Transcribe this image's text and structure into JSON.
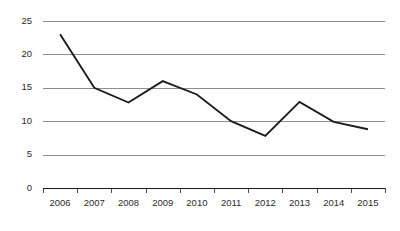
{
  "chart_data": {
    "type": "line",
    "title": "",
    "subtitle": "",
    "xlabel": "",
    "ylabel": "",
    "categories": [
      "2006",
      "2007",
      "2008",
      "2009",
      "2010",
      "2011",
      "2012",
      "2013",
      "2014",
      "2015"
    ],
    "values": [
      23,
      15,
      12.8,
      16,
      14,
      10,
      7.8,
      12.9,
      9.9,
      8.8
    ],
    "series": [
      {
        "name": "",
        "values": [
          23,
          15,
          12.8,
          16,
          14,
          10,
          7.8,
          12.9,
          9.9,
          8.8
        ]
      }
    ],
    "ylim": [
      0,
      25
    ],
    "ytick_labels": [
      "0",
      "5",
      "10",
      "15",
      "20",
      "25"
    ],
    "ytick_values": [
      0,
      5,
      10,
      15,
      20,
      25
    ],
    "xtick_labels": [
      "2006",
      "2007",
      "2008",
      "2009",
      "2010",
      "2011",
      "2012",
      "2013",
      "2014",
      "2015"
    ],
    "grid": true,
    "grid_axis": "y",
    "legend": false,
    "legend_position": "none",
    "line_color": "#1c1c1c",
    "grid_color": "#8d8d8d",
    "axis_color": "#1a1a1a",
    "background_color": "#ffffff",
    "markers": false,
    "annotations": []
  },
  "layout": {
    "plot_left": 43,
    "plot_right": 385,
    "plot_top": 21,
    "plot_bottom": 188
  }
}
